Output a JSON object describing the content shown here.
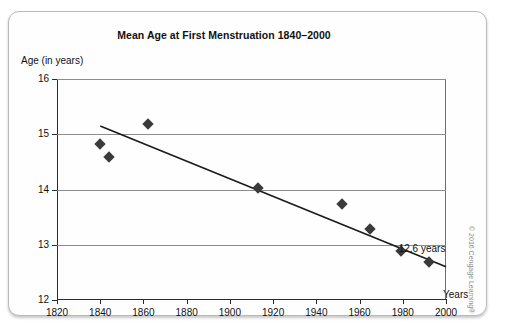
{
  "chart_data": {
    "type": "scatter",
    "title": "Mean Age at First Menstruation 1840–2000",
    "xlabel": "Years",
    "ylabel": "Age (in years)",
    "xlim": [
      1820,
      2000
    ],
    "ylim": [
      12,
      16
    ],
    "grid": true,
    "legend": "none",
    "xticks": [
      1820,
      1840,
      1860,
      1880,
      1900,
      1920,
      1940,
      1960,
      1980,
      2000
    ],
    "yticks": [
      12,
      13,
      14,
      15,
      16
    ],
    "points": [
      {
        "x": 1840,
        "y": 14.82
      },
      {
        "x": 1844,
        "y": 14.58
      },
      {
        "x": 1862,
        "y": 15.18
      },
      {
        "x": 1913,
        "y": 14.02
      },
      {
        "x": 1952,
        "y": 13.74
      },
      {
        "x": 1965,
        "y": 13.28
      },
      {
        "x": 1979,
        "y": 12.89
      },
      {
        "x": 1992,
        "y": 12.68
      }
    ],
    "trendline": {
      "x0": 1840,
      "y0": 15.15,
      "x1": 2000,
      "y1": 12.6
    },
    "annotations": [
      {
        "text": "12.6 years",
        "x": 1992,
        "y": 12.93
      }
    ],
    "series_color": "#3a3a3a",
    "trendline_color": "#1a1a1a",
    "grid_color": "#8c8c8c"
  },
  "credit": {
    "text": "© 2016 Cengage Learning®"
  }
}
